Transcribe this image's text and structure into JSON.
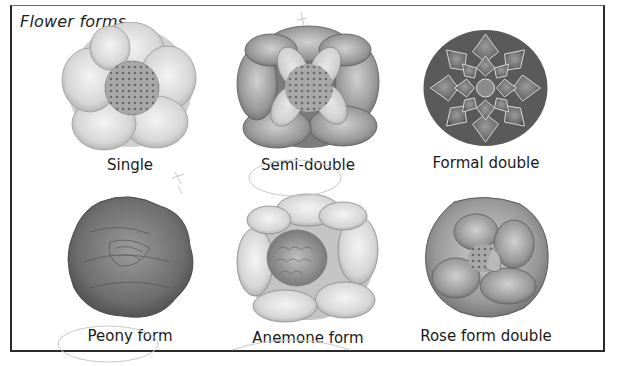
{
  "figure": {
    "title": "Flower forms",
    "colors": {
      "border": "#2a2a2a",
      "text": "#1a1a1a",
      "background": "#ffffff"
    },
    "forms": [
      {
        "id": "single",
        "label": "Single",
        "row": 1,
        "col": 1,
        "icon": "single-flower-icon"
      },
      {
        "id": "semi-double",
        "label": "Semi-double",
        "row": 1,
        "col": 2,
        "icon": "semi-double-flower-icon"
      },
      {
        "id": "formal-double",
        "label": "Formal double",
        "row": 1,
        "col": 3,
        "icon": "formal-double-flower-icon"
      },
      {
        "id": "peony",
        "label": "Peony form",
        "row": 2,
        "col": 1,
        "icon": "peony-flower-icon"
      },
      {
        "id": "anemone",
        "label": "Anemone form",
        "row": 2,
        "col": 2,
        "icon": "anemone-flower-icon"
      },
      {
        "id": "rose-double",
        "label": "Rose form double",
        "row": 2,
        "col": 3,
        "icon": "rose-double-flower-icon"
      }
    ]
  }
}
